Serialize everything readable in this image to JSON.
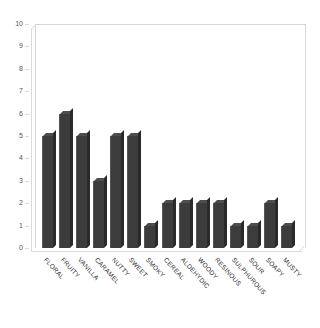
{
  "chart_data": {
    "type": "bar",
    "title": "",
    "subtitle": "",
    "xlabel": "",
    "ylabel": "",
    "ylim": [
      0,
      10
    ],
    "y_ticks": [
      0,
      1,
      2,
      3,
      4,
      5,
      6,
      7,
      8,
      9,
      10
    ],
    "grid": false,
    "legend": false,
    "legend_position": "none",
    "bar_color": "#3c3c3c",
    "categories": [
      "FLORAL",
      "FRUITY",
      "VANILLA",
      "CARAMEL",
      "NUTTY",
      "SWEET",
      "SMOKY",
      "CEREAL",
      "ALDEHYDIC",
      "WOODY",
      "RESINOUS",
      "SULPHUROUS",
      "SOUR",
      "SOAPY",
      "MUSTY"
    ],
    "values": [
      5,
      6,
      5,
      3,
      5,
      5,
      1,
      2,
      2,
      2,
      2,
      1,
      1,
      2,
      1
    ]
  },
  "style": {
    "background": "#ffffff",
    "axis_color": "#d8d8d8",
    "tick_text_color": "#55565a",
    "label_text_color": "#2f2f2f"
  }
}
